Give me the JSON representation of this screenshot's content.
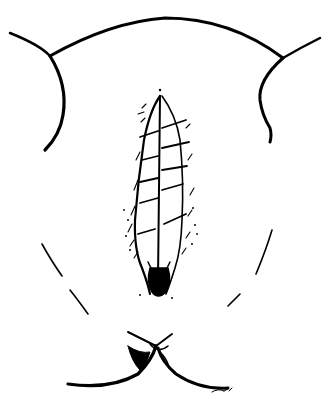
{
  "figure": {
    "kind": "surgical line illustration",
    "subject": "sutured midline incision (perineal/vulvar region), anterior view",
    "style": "black ink line drawing on white",
    "colors": {
      "ink": "#000000",
      "background": "#ffffff"
    },
    "elements": {
      "upper_contour": "abdominal/thigh outline arc",
      "incision": "vertical midline incision with interrupted sutures",
      "suture_count": 7,
      "lower_structure": "anal/perineal fold"
    },
    "signature": "illegible artist signature (lower right)"
  }
}
